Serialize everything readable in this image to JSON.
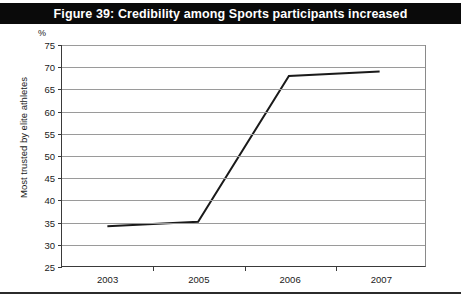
{
  "figure": {
    "title": "Figure 39: Credibility among Sports participants increased",
    "unit_label": "%"
  },
  "colors": {
    "title_bar_background": "#0a0a0a",
    "title_text": "#ffffff",
    "gridline": "#9a9a9a",
    "axis": "#3a3a3a",
    "data_line": "#1a1a1a",
    "bottom_rule": "#2b2b2b",
    "page_background": "#ffffff"
  },
  "chart_data": {
    "type": "line",
    "title": "Figure 39: Credibility among Sports participants increased",
    "xlabel": "",
    "ylabel": "Most trusted by elite athletes",
    "unit": "%",
    "categories": [
      "2003",
      "2005",
      "2006",
      "2007"
    ],
    "values": [
      34,
      35,
      68,
      69
    ],
    "ylim": [
      25,
      75
    ],
    "yticks": [
      25,
      30,
      35,
      40,
      45,
      50,
      55,
      60,
      65,
      70,
      75
    ],
    "ytick_labels": [
      "25",
      "30",
      "35",
      "40",
      "45",
      "50",
      "55",
      "60",
      "65",
      "70",
      "75"
    ],
    "grid": true,
    "grid_axis": "y",
    "legend": false,
    "legend_position": "none",
    "series": [
      {
        "name": "Most trusted by elite athletes",
        "values": [
          34,
          35,
          68,
          69
        ]
      }
    ]
  }
}
